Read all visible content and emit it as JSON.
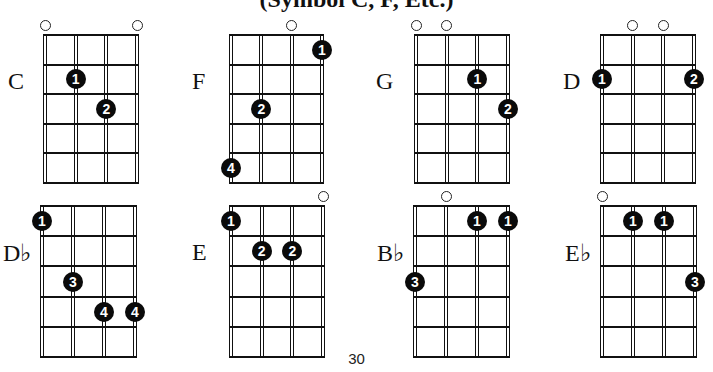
{
  "title": "(Symbol C, F, Etc.)",
  "page_number": "30",
  "layout": {
    "strings": 4,
    "frets": 5
  },
  "chords": [
    {
      "name": "C",
      "gx": 45,
      "gy": 35,
      "gw": 92,
      "gh": 148,
      "lx": 8,
      "open": [
        0,
        3
      ],
      "fingers": [
        {
          "s": 1,
          "f": 2,
          "n": "1"
        },
        {
          "s": 2,
          "f": 3,
          "n": "2"
        }
      ]
    },
    {
      "name": "F",
      "gx": 231,
      "gy": 35,
      "gw": 91,
      "gh": 148,
      "lx": 192,
      "open": [
        2
      ],
      "fingers": [
        {
          "s": 3,
          "f": 1,
          "n": "1"
        },
        {
          "s": 1,
          "f": 3,
          "n": "2"
        },
        {
          "s": 0,
          "f": 5,
          "n": "4"
        }
      ]
    },
    {
      "name": "G",
      "gx": 416,
      "gy": 35,
      "gw": 92,
      "gh": 148,
      "lx": 376,
      "open": [
        0,
        1
      ],
      "fingers": [
        {
          "s": 2,
          "f": 2,
          "n": "1"
        },
        {
          "s": 3,
          "f": 3,
          "n": "2"
        }
      ]
    },
    {
      "name": "D",
      "gx": 602,
      "gy": 35,
      "gw": 92,
      "gh": 148,
      "lx": 563,
      "open": [
        1,
        2
      ],
      "fingers": [
        {
          "s": 0,
          "f": 2,
          "n": "1"
        },
        {
          "s": 3,
          "f": 2,
          "n": "2"
        }
      ]
    },
    {
      "name": "D♭",
      "gx": 42,
      "gy": 206,
      "gw": 93,
      "gh": 151,
      "lx": 3,
      "open": [],
      "fingers": [
        {
          "s": 0,
          "f": 1,
          "n": "1"
        },
        {
          "s": 1,
          "f": 3,
          "n": "3"
        },
        {
          "s": 2,
          "f": 4,
          "n": "4"
        },
        {
          "s": 3,
          "f": 4,
          "n": "4"
        }
      ]
    },
    {
      "name": "E",
      "gx": 231,
      "gy": 206,
      "gw": 92,
      "gh": 151,
      "lx": 192,
      "open": [
        3
      ],
      "fingers": [
        {
          "s": 0,
          "f": 1,
          "n": "1"
        },
        {
          "s": 1,
          "f": 2,
          "n": "2"
        },
        {
          "s": 2,
          "f": 2,
          "n": "2"
        }
      ]
    },
    {
      "name": "B♭",
      "gx": 415,
      "gy": 206,
      "gw": 93,
      "gh": 151,
      "lx": 377,
      "open": [
        1
      ],
      "fingers": [
        {
          "s": 2,
          "f": 1,
          "n": "1"
        },
        {
          "s": 3,
          "f": 1,
          "n": "1"
        },
        {
          "s": 0,
          "f": 3,
          "n": "3"
        }
      ]
    },
    {
      "name": "E♭",
      "gx": 602,
      "gy": 206,
      "gw": 93,
      "gh": 151,
      "lx": 565,
      "open": [
        0
      ],
      "fingers": [
        {
          "s": 1,
          "f": 1,
          "n": "1"
        },
        {
          "s": 2,
          "f": 1,
          "n": "1"
        },
        {
          "s": 3,
          "f": 3,
          "n": "3"
        }
      ]
    }
  ]
}
